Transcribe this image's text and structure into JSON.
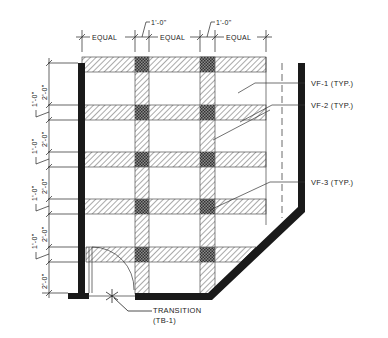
{
  "drawing": {
    "title": "Floor pattern plan",
    "colors": {
      "ink": "#1a1a1a",
      "hatch": "#555555",
      "crosshatch": "#3a3a3a",
      "background": "#ffffff"
    }
  },
  "top_dimensions": {
    "segments": [
      "EQUAL",
      "EQUAL",
      "EQUAL"
    ],
    "callouts": [
      "1'-0\"",
      "1'-0\""
    ]
  },
  "left_dimensions": {
    "groups": [
      {
        "large": "2'-0\"",
        "small": "1'-0\""
      },
      {
        "large": "2'-0\"",
        "small": "1'-0\""
      },
      {
        "large": "2'-0\"",
        "small": "1'-0\""
      },
      {
        "large": "2'-0\"",
        "small": "1'-0\""
      },
      {
        "large": "2'-0\"",
        "small": ""
      }
    ]
  },
  "callouts": [
    {
      "id": "vf1",
      "text": "VF-1 (TYP.)"
    },
    {
      "id": "vf2",
      "text": "VF-2 (TYP.)"
    },
    {
      "id": "vf3",
      "text": "VF-3 (TYP.)"
    }
  ],
  "transition": {
    "line1": "TRANSITION",
    "line2": "(TB-1)"
  }
}
